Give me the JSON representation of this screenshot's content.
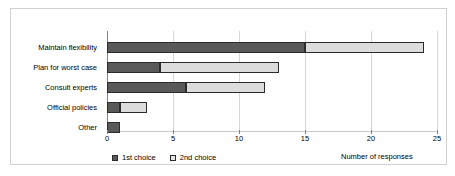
{
  "chart_data": {
    "type": "bar",
    "orientation": "horizontal",
    "stacked": true,
    "title": "",
    "xlabel": "Number of responses",
    "ylabel": "",
    "xlim": [
      0,
      25
    ],
    "xticks": [
      0,
      5,
      10,
      15,
      20,
      25
    ],
    "grid": true,
    "legend_position": "bottom-left",
    "categories": [
      "Maintain flexibility",
      "Plan for worst case",
      "Consult experts",
      "Official policies",
      "Other"
    ],
    "series": [
      {
        "name": "1st choice",
        "color": "#595959",
        "values": [
          15,
          4,
          6,
          1,
          1
        ]
      },
      {
        "name": "2nd choice",
        "color": "#dcdcdc",
        "values": [
          9,
          9,
          6,
          2,
          0
        ]
      }
    ],
    "totals": [
      24,
      13,
      12,
      3,
      1
    ]
  }
}
